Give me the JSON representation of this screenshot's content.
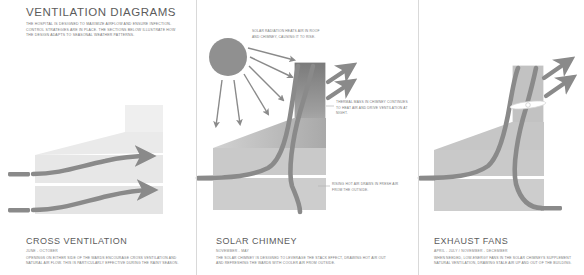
{
  "header": {
    "title": "VENTILATION DIAGRAMS",
    "intro": "THE HOSPITAL IS DESIGNED TO MAXIMIZE AIRFLOW AND ENSURE INFECTION-CONTROL STRATEGIES ARE IN PLACE. THE SECTIONS BELOW ILLUSTRATE HOW THE DESIGN ADAPTS TO SEASONAL WEATHER PATTERNS."
  },
  "panels": [
    {
      "id": "cross-ventilation",
      "title": "CROSS VENTILATION",
      "season": "JUNE - OCTOBER",
      "body": "OPENINGS ON EITHER SIDE OF THE WARDS ENCOURAGE CROSS VENTILATION AND NATURAL AIR FLOW. THIS IS PARTICULARLY EFFECTIVE DURING THE RAINY SEASON."
    },
    {
      "id": "solar-chimney",
      "title": "SOLAR CHIMNEY",
      "season": "NOVEMBER - MAY",
      "body": "THE SOLAR CHIMNEY IS DESIGNED TO LEVERAGE THE STACK EFFECT, DRAWING HOT AIR OUT AND REFRESHING THE WARDS WITH COOLER AIR FROM OUTSIDE."
    },
    {
      "id": "exhaust-fans",
      "title": "EXHAUST FANS",
      "season": "APRIL - JULY / NOVEMBER - DECEMBER",
      "body": "WHEN NEEDED, LOW-ENERGY FANS IN THE SOLAR CHIMNEYS SUPPLEMENT NATURAL VENTILATION, DRAWING STALE AIR UP AND OUT OF THE BUILDING."
    }
  ],
  "annotations": {
    "solar_radiation": "SOLAR RADIATION HEATS AIR IN ROOF AND CHIMNEY, CAUSING IT TO RISE.",
    "thermal_mass": "THERMAL MASS IN CHIMNEY CONTINUES TO HEAT AIR AND DRIVE VENTILATION AT NIGHT.",
    "rising_air": "RISING HOT AIR DRAWS IN FRESH AIR FROM THE OUTSIDE."
  },
  "icons": {
    "sun": "sun-icon",
    "fan": "fan-icon",
    "airflow_arrow": "airflow-arrow-icon",
    "sun_ray": "sun-ray-icon"
  },
  "colors": {
    "building_light": "#e6e6e6",
    "building_mid": "#cfcfcf",
    "building_dark": "#9a9a9a",
    "chimney_dark": "#6f6f6f",
    "arrow": "#8a8a8a",
    "sun": "#909090",
    "text": "#7a7a7a",
    "heading": "#5c5c5c",
    "divider": "#d9d9d9",
    "background": "#ffffff"
  }
}
